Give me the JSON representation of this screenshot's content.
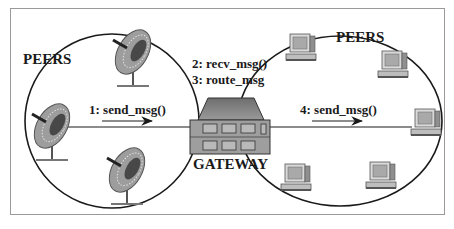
{
  "diagram": {
    "left_group": {
      "label": "PEERS",
      "node_type": "satellite-dish",
      "node_count": 3
    },
    "right_group": {
      "label": "PEERS",
      "node_type": "desktop-computer",
      "node_count": 5
    },
    "hub": {
      "label": "GATEWAY"
    },
    "steps": [
      {
        "text": "1: send_msg()"
      },
      {
        "text": "2: recv_msg()"
      },
      {
        "text": "3: route_msg"
      },
      {
        "text": "4: send_msg()"
      }
    ],
    "colors": {
      "line": "#1a1a1a",
      "frame": "#9a9a9a",
      "gateway_roof": "#8a8a8a",
      "gateway_body": "#9c9c9c",
      "window": "#b8b8b8",
      "dish": "#a0a0a0",
      "monitor": "#c8c8c8"
    }
  }
}
